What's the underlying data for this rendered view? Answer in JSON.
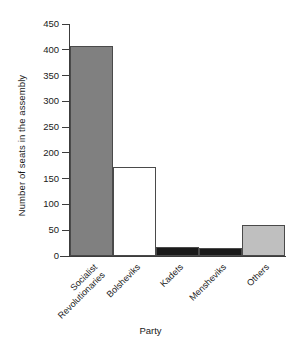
{
  "chart_data": {
    "type": "bar",
    "title": "",
    "xlabel": "Party",
    "ylabel": "Number of seats in the assembly",
    "categories": [
      "Socialist\nRevolutionaries",
      "Bolsheviks",
      "Kadets",
      "Mensheviks",
      "Others"
    ],
    "values": [
      408,
      173,
      17,
      16,
      60
    ],
    "ylim": [
      0,
      450
    ],
    "ytick_labels": [
      "0",
      "50",
      "100",
      "150",
      "200",
      "250",
      "300",
      "350",
      "400",
      "450"
    ],
    "ytick_values": [
      0,
      50,
      100,
      150,
      200,
      250,
      300,
      350,
      400,
      450
    ],
    "grid": false,
    "legend": "none",
    "bar_colors": [
      "#808080",
      "#ffffff",
      "#1a1a1a",
      "#1a1a1a",
      "#bfbfbf"
    ],
    "bar_edge_color": "#4a4a4a",
    "axis_color": "#3c3c3c",
    "bar_fill_patterns": [
      "hatched",
      "solid",
      "solid",
      "solid",
      "solid"
    ]
  }
}
